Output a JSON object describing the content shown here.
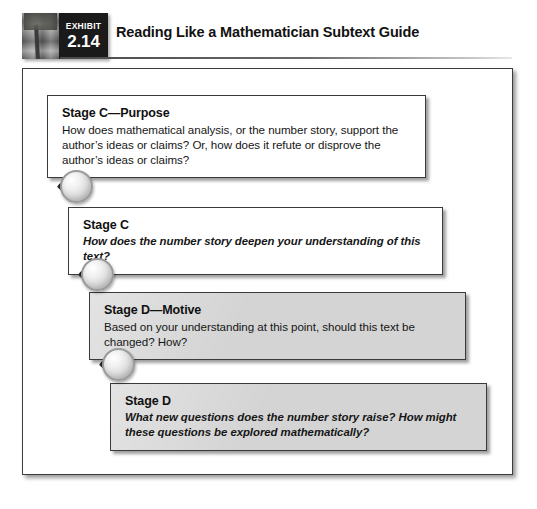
{
  "header": {
    "badge": {
      "label": "EXHIBIT",
      "number": "2.14",
      "photo_icon": "tree-photo"
    },
    "title": "Reading Like a Mathematician Subtext Guide"
  },
  "stages": [
    {
      "id": "stage-c-purpose",
      "title": "Stage C—Purpose",
      "body": "How does mathematical analysis, or the number story, support the author’s ideas or claims? Or, how does it refute or disprove the author’s ideas or claims?",
      "style": "white",
      "italic": false
    },
    {
      "id": "stage-c",
      "title": "Stage C",
      "body": "How does the number story deepen your understanding of this text?",
      "style": "white",
      "italic": true
    },
    {
      "id": "stage-d-motive",
      "title": "Stage D—Motive",
      "body": "Based on your understanding at this point, should this text be changed? How?",
      "style": "gray",
      "italic": false
    },
    {
      "id": "stage-d",
      "title": "Stage D",
      "body": "What new questions does the number story raise? How might these questions be explored mathematically?",
      "style": "gray",
      "italic": true
    }
  ],
  "connectors": [
    {
      "id": "magnifier-1",
      "icon": "magnifying-glass-icon"
    },
    {
      "id": "magnifier-2",
      "icon": "magnifying-glass-icon"
    },
    {
      "id": "magnifier-3",
      "icon": "magnifying-glass-icon"
    }
  ],
  "colors": {
    "badge_background": "#1a1a1a",
    "frame_border": "#3c3c3c",
    "gray_box": "#d4d4d4",
    "text": "#121212"
  }
}
